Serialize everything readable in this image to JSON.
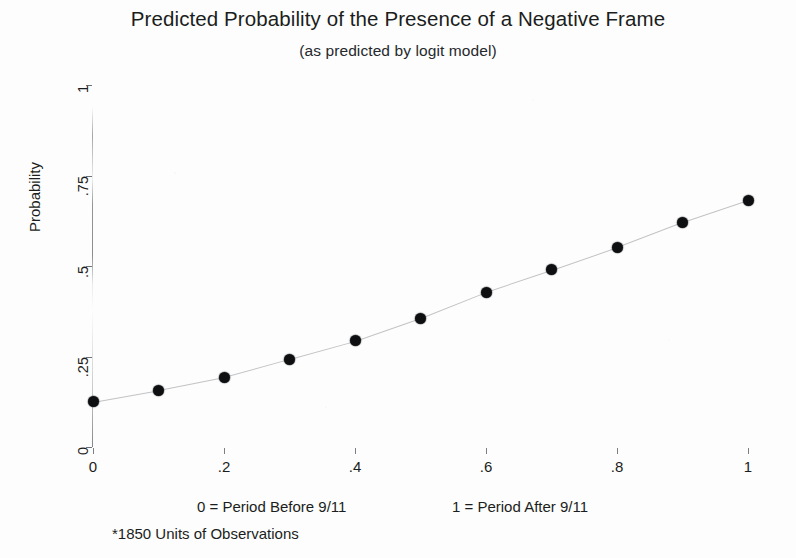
{
  "chart_data": {
    "type": "scatter",
    "title": "Predicted Probability of the Presence of a Negative Frame",
    "subtitle": "(as predicted by logit model)",
    "xlabel": "",
    "ylabel": "Probability",
    "xlim": [
      0,
      1
    ],
    "ylim": [
      0,
      1
    ],
    "grid": false,
    "legend": null,
    "x_ticks": [
      "0",
      ".2",
      ".4",
      ".6",
      ".8",
      "1"
    ],
    "x_tick_values": [
      0,
      0.2,
      0.4,
      0.6,
      0.8,
      1
    ],
    "y_ticks": [
      "0",
      ".25",
      ".5",
      ".75",
      "1"
    ],
    "y_tick_values": [
      0,
      0.25,
      0.5,
      0.75,
      1
    ],
    "x": [
      0,
      0.1,
      0.2,
      0.3,
      0.4,
      0.5,
      0.6,
      0.7,
      0.8,
      0.9,
      1
    ],
    "values": [
      0.125,
      0.157,
      0.193,
      0.243,
      0.293,
      0.356,
      0.428,
      0.489,
      0.552,
      0.621,
      0.682
    ],
    "annotations": [
      "0 = Period Before 9/11",
      "1 = Period After 9/11",
      "*1850 Units of Observations"
    ],
    "marker_color": "#0d0f11",
    "background_color": "#ffffff"
  },
  "notes": {
    "before": "0 = Period Before 9/11",
    "after": "1 = Period After 9/11",
    "observations": "*1850 Units of Observations"
  }
}
